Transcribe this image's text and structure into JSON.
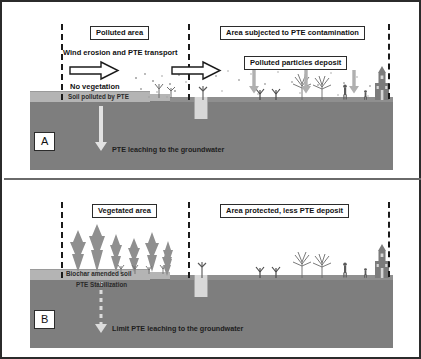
{
  "figure": {
    "type": "two-panel conceptual diagram",
    "panels": [
      {
        "tag": "A",
        "title_left": "Polluted area",
        "title_right": "Area subjected to PTE contamination",
        "label_wind": "Wind erosion and PTE transport",
        "label_novegetation": "No vegetation",
        "label_deposit": "Polluted particles deposit",
        "label_soil": "Soil polluted by PTE",
        "label_leaching": "PTE leaching to the groundwater",
        "wind_arrows": 2,
        "deposit_arrows": 3
      },
      {
        "tag": "B",
        "title_left": "Vegetated area",
        "title_right": "Area protected, less PTE deposit",
        "label_soil_line1": "Biochar amended soil",
        "label_soil_line2": "PTE Stabilization",
        "label_leaching": "Limit PTE leaching to the groundwater",
        "wind_arrows": 0,
        "deposit_arrows": 0
      }
    ]
  },
  "icons": {
    "wind_arrow": "right-block-arrow-icon",
    "deposit_arrow": "down-arrow-icon",
    "leaching_arrow": "down-arrow-icon",
    "leaching_arrow_dashed": "down-dashed-arrow-icon",
    "conifer": "conifer-tree-icon",
    "bare_tree": "bare-tree-icon",
    "shrub": "shrub-icon",
    "person": "person-icon",
    "church": "church-icon",
    "well": "well-icon",
    "dust": "dust-particles-icon"
  },
  "colors": {
    "frame": "#2b2b2b",
    "topsoil": "#b4b4b4",
    "subsoil": "#7e7e7e",
    "ground": "#8f8f8f",
    "vegetation": "#8c8c8c",
    "arrow_fill": "#ffffff",
    "arrow_stroke": "#1b1b1b",
    "deposit_arrow": "#a9a9a9",
    "dashed_boundary": "#1b1b1b",
    "background": "#ffffff"
  }
}
